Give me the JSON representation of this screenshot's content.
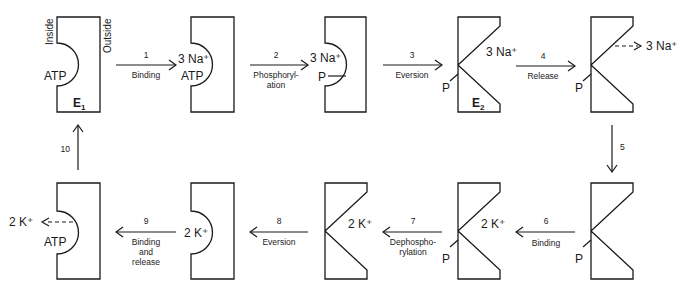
{
  "diagram": {
    "side_labels": {
      "inside": "Inside",
      "outside": "Outside"
    },
    "states": [
      {
        "id": "s1",
        "conformation": "E1",
        "label_main": "ATP",
        "enzyme_label": "E",
        "enzyme_sub": "1"
      },
      {
        "id": "s2",
        "conformation": "E1",
        "ion_label": "3 Na⁺",
        "label_main": "ATP"
      },
      {
        "id": "s3",
        "conformation": "E1",
        "ion_label": "3 Na⁺",
        "phosphate": "P"
      },
      {
        "id": "s4",
        "conformation": "E2",
        "ion_label": "3 Na⁺",
        "phosphate": "P",
        "enzyme_label": "E",
        "enzyme_sub": "2"
      },
      {
        "id": "s5",
        "conformation": "E2",
        "released_ion": "3 Na⁺",
        "phosphate": "P"
      },
      {
        "id": "s6",
        "conformation": "E2",
        "phosphate": "P"
      },
      {
        "id": "s7",
        "conformation": "E2",
        "ion_label": "2 K⁺",
        "phosphate": "P"
      },
      {
        "id": "s8",
        "conformation": "E2",
        "ion_label": "2 K⁺"
      },
      {
        "id": "s9",
        "conformation": "E1",
        "ion_label": "2 K⁺"
      },
      {
        "id": "s10",
        "conformation": "E1",
        "released_ion": "2 K⁺",
        "label_main": "ATP"
      }
    ],
    "steps": [
      {
        "number": "1",
        "label": "Binding"
      },
      {
        "number": "2",
        "label_line1": "Phosphoryl-",
        "label_line2": "ation"
      },
      {
        "number": "3",
        "label": "Eversion"
      },
      {
        "number": "4",
        "label": "Release"
      },
      {
        "number": "5"
      },
      {
        "number": "6",
        "label": "Binding"
      },
      {
        "number": "7",
        "label_line1": "Dephospho-",
        "label_line2": "rylation"
      },
      {
        "number": "8",
        "label": "Eversion"
      },
      {
        "number": "9",
        "label_line1": "Binding",
        "label_line2": "and",
        "label_line3": "release"
      },
      {
        "number": "10"
      }
    ]
  }
}
